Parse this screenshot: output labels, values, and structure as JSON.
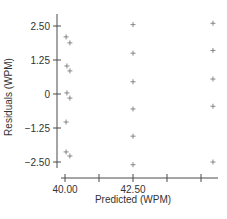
{
  "chart_data": {
    "type": "scatter",
    "title": "",
    "xlabel": "Predicted (WPM)",
    "ylabel": "Residuals (WPM)",
    "xlim": [
      40.0,
      45.75
    ],
    "ylim": [
      -2.5,
      2.5
    ],
    "x_ticks": [
      40.0,
      41.25,
      42.5,
      43.75,
      45.0
    ],
    "x_tick_labels": [
      "40.00",
      "",
      "42.50",
      "",
      ""
    ],
    "y_ticks": [
      2.5,
      1.25,
      0,
      -1.25,
      -2.5
    ],
    "y_tick_labels": [
      "2.50",
      "1.25",
      "0",
      "-1.25",
      "-2.50"
    ],
    "grid": false,
    "legend": null,
    "marker": "+",
    "series": [
      {
        "name": "residuals",
        "points": [
          {
            "x": 40.04,
            "y": 2.1
          },
          {
            "x": 40.18,
            "y": 1.88
          },
          {
            "x": 40.07,
            "y": 1.03
          },
          {
            "x": 40.18,
            "y": 0.85
          },
          {
            "x": 40.07,
            "y": 0.04
          },
          {
            "x": 40.18,
            "y": -0.15
          },
          {
            "x": 40.04,
            "y": -1.03
          },
          {
            "x": 40.04,
            "y": -2.13
          },
          {
            "x": 40.18,
            "y": -2.28
          },
          {
            "x": 42.5,
            "y": 2.55
          },
          {
            "x": 42.5,
            "y": 1.5
          },
          {
            "x": 42.5,
            "y": 0.45
          },
          {
            "x": 42.5,
            "y": -0.55
          },
          {
            "x": 42.5,
            "y": -1.55
          },
          {
            "x": 42.5,
            "y": -2.6
          },
          {
            "x": 45.44,
            "y": 2.6
          },
          {
            "x": 45.44,
            "y": 1.6
          },
          {
            "x": 45.44,
            "y": 0.55
          },
          {
            "x": 45.44,
            "y": -0.45
          },
          {
            "x": 45.44,
            "y": -2.5
          }
        ]
      }
    ]
  },
  "colors": {
    "axis": "#4a4a4a",
    "marker": "#7a7a7a",
    "text": "#333333",
    "background": "#ffffff"
  }
}
